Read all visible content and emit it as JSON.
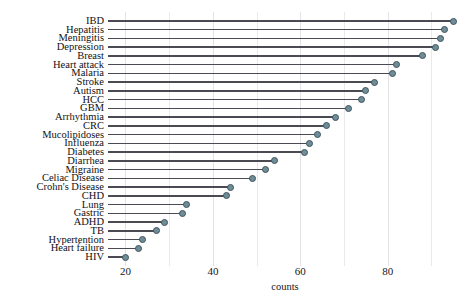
{
  "chart_data": {
    "type": "bar",
    "subtype": "lollipop-horizontal",
    "title": "",
    "subtitle": "",
    "xlabel": "counts",
    "ylabel": "",
    "xlim": [
      16,
      97
    ],
    "ylim": null,
    "grid": true,
    "grid_axis": "x",
    "legend": null,
    "orientation": "horizontal",
    "sorted": "descending",
    "xticks": [
      20,
      40,
      60,
      80
    ],
    "xticks_minor": [
      30,
      50,
      70,
      90
    ],
    "categories": [
      "IBD",
      "Hepatitis",
      "Meningitis",
      "Depression",
      "Breast",
      "Heart attack",
      "Malaria",
      "Stroke",
      "Autism",
      "HCC",
      "GBM",
      "Arrhythmia",
      "CRC",
      "Mucolipidoses",
      "Influenza",
      "Diabetes",
      "Diarrhea",
      "Migraine",
      "Celiac Disease",
      "Crohn's Disease",
      "CHD",
      "Lung",
      "Gastric",
      "ADHD",
      "TB",
      "Hypertention",
      "Heart failure",
      "HIV"
    ],
    "values": [
      95,
      93,
      92,
      91,
      88,
      82,
      81,
      77,
      75,
      74,
      71,
      68,
      66,
      64,
      62,
      61,
      54,
      52,
      49,
      44,
      43,
      34,
      33,
      29,
      27,
      24,
      23,
      20
    ],
    "marker_color": "#6d8e99",
    "marker_edge_color": "#41525a",
    "stem_color": "#4a4a52"
  },
  "axis": {
    "x_title": "counts",
    "tick_labels": [
      "20",
      "40",
      "60",
      "80"
    ]
  },
  "colors": {
    "background": "#ffffff",
    "grid": "#e9e9ec",
    "text": "#16161a",
    "marker": "#6d8e99",
    "marker_edge": "#41525a",
    "stem": "#4a4a52"
  }
}
